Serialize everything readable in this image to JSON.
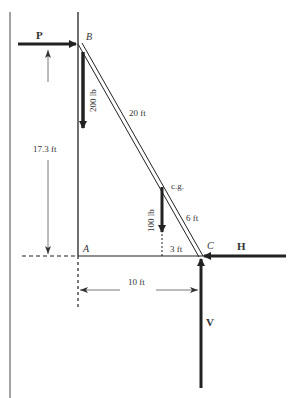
{
  "diagram": {
    "points": {
      "A": "A",
      "B": "B",
      "C": "C"
    },
    "forces": {
      "P": "P",
      "H": "H",
      "V": "V",
      "weight_at_B": "200 lb",
      "weight_at_cg": "100 lb"
    },
    "labels": {
      "cg": "c.g.",
      "length_BC_upper": "20 ft",
      "length_cg_C": "6 ft",
      "horizontal_cg_C": "3 ft",
      "height": "17.3 ft",
      "base": "10 ft"
    },
    "colors": {
      "line": "#222222",
      "thin_line": "#555555",
      "background": "#ffffff"
    }
  }
}
